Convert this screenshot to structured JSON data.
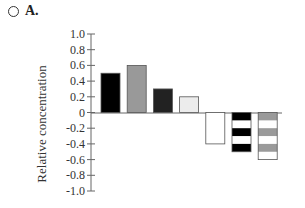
{
  "header": {
    "option_label": "A.",
    "radio_icon": "radio-button-empty"
  },
  "chart_data": {
    "type": "bar",
    "title": "",
    "xlabel": "",
    "ylabel": "Relative concentration",
    "ylim": [
      -1.0,
      1.0
    ],
    "yticks": [
      "1.0",
      "0.8",
      "0.6",
      "0.4",
      "0.2",
      "0",
      "-0.2",
      "-0.4",
      "-0.6",
      "-0.8",
      "-1.0"
    ],
    "grid": false,
    "legend": null,
    "categories": [
      "1",
      "2",
      "3",
      "4",
      "5",
      "6",
      "7"
    ],
    "values": [
      0.5,
      0.6,
      0.3,
      0.2,
      -0.4,
      -0.5,
      -0.6
    ],
    "bar_styles": [
      {
        "fill": "#000000",
        "pattern": "solid"
      },
      {
        "fill": "#999999",
        "pattern": "solid"
      },
      {
        "fill": "#222222",
        "pattern": "solid"
      },
      {
        "fill": "#ececec",
        "pattern": "solid"
      },
      {
        "fill": "#ffffff",
        "pattern": "solid"
      },
      {
        "fill": "#000000",
        "pattern": "horizontal-stripes-black-white"
      },
      {
        "fill": "#9a9a9a",
        "pattern": "horizontal-stripes-gray-white"
      }
    ]
  }
}
